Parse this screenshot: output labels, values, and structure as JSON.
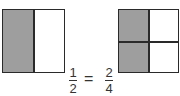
{
  "left_square": {
    "parts": 2,
    "shaded": 1,
    "shade_color": "#9e9e9e"
  },
  "right_square": {
    "parts": 4,
    "shaded": 2,
    "shade_color": "#9e9e9e"
  },
  "equation": {
    "left": {
      "numerator": "1",
      "denominator": "2"
    },
    "operator": "=",
    "right": {
      "numerator": "2",
      "denominator": "4"
    }
  }
}
